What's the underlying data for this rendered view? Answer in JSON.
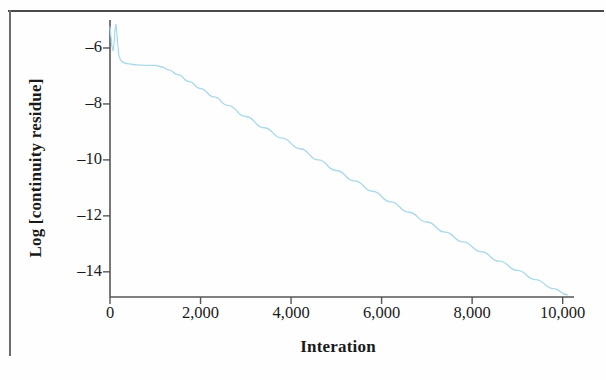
{
  "chart_data": {
    "type": "line",
    "title": "",
    "xlabel": "Interation",
    "ylabel": "Log [continuity residue]",
    "xlim": [
      0,
      10250
    ],
    "ylim": [
      -14.9,
      -5.0
    ],
    "grid": false,
    "legend": null,
    "line_color": "#a9d9ea",
    "axis_color": "#555555",
    "xticks": [
      0,
      2000,
      4000,
      6000,
      8000,
      10000
    ],
    "xtick_labels": [
      "0",
      "2,000",
      "4,000",
      "6,000",
      "8,000",
      "10,000"
    ],
    "yticks": [
      -6,
      -8,
      -10,
      -12,
      -14
    ],
    "ytick_labels": [
      "–6",
      "–8",
      "–10",
      "–12",
      "–14"
    ],
    "series": [
      {
        "name": "continuity residue",
        "x": [
          0,
          20,
          45,
          70,
          90,
          110,
          130,
          150,
          175,
          200,
          240,
          300,
          380,
          470,
          560,
          650,
          760,
          880,
          1000,
          1150,
          1300,
          1500,
          1750,
          2000,
          2300,
          2600,
          3000,
          3400,
          3800,
          4200,
          4600,
          5000,
          5400,
          5800,
          6200,
          6600,
          7000,
          7400,
          7800,
          8200,
          8600,
          9000,
          9400,
          9800,
          10100
        ],
        "y": [
          -5.25,
          -5.6,
          -5.95,
          -6.1,
          -5.85,
          -5.35,
          -5.15,
          -5.45,
          -5.95,
          -6.3,
          -6.45,
          -6.52,
          -6.56,
          -6.58,
          -6.6,
          -6.61,
          -6.62,
          -6.62,
          -6.62,
          -6.68,
          -6.78,
          -6.95,
          -7.2,
          -7.45,
          -7.75,
          -8.05,
          -8.45,
          -8.85,
          -9.22,
          -9.6,
          -10.0,
          -10.38,
          -10.75,
          -11.12,
          -11.5,
          -11.87,
          -12.22,
          -12.58,
          -12.93,
          -13.28,
          -13.62,
          -13.95,
          -14.28,
          -14.6,
          -14.82
        ]
      }
    ],
    "annotations": [
      {
        "text": "initial transient spike near iteration 100",
        "x": 110,
        "y": -5.15
      },
      {
        "text": "plateau around log residue -6.6 from ~400 to ~1100 iterations",
        "x": 750,
        "y": -6.6
      },
      {
        "text": "near-linear decay from ~1200 to 10,000 iterations",
        "x": 5500,
        "y": -10.5
      }
    ]
  }
}
